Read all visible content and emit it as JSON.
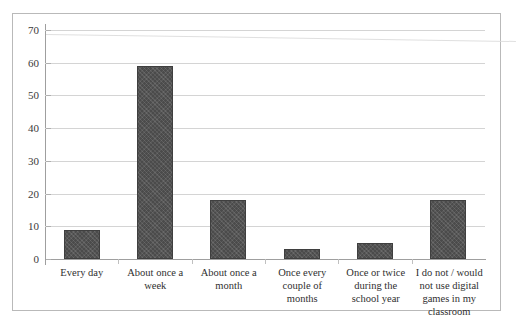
{
  "chart_data": {
    "type": "bar",
    "title": "",
    "subtitle": "",
    "xlabel": "",
    "ylabel": "",
    "ylim": [
      0,
      70
    ],
    "ytick_step": 10,
    "yticks": [
      0,
      10,
      20,
      30,
      40,
      50,
      60,
      70
    ],
    "ytick_labels": [
      "0",
      "10",
      "20",
      "30",
      "40",
      "50",
      "60",
      "70"
    ],
    "grid": true,
    "legend": false,
    "legend_position": "none",
    "categories": [
      "Every day",
      "About once a week",
      "About once a month",
      "Once every couple of months",
      "Once or twice during the school year",
      "I do not / would not use digital games in my classroom"
    ],
    "values": [
      9,
      59,
      18,
      3,
      5,
      18
    ],
    "series": [
      {
        "name": "Responses",
        "values": [
          9,
          59,
          18,
          3,
          5,
          18
        ],
        "color": "#4b4b4b"
      }
    ],
    "annotations": []
  },
  "figure": {
    "border_color": "#b9b9b9",
    "background": "#ffffff",
    "gridline_color": "#d4d4d4",
    "axis_color": "#9f9f9f",
    "bar_color": "#4b4b4b",
    "label_color": "#2f2f2f"
  }
}
